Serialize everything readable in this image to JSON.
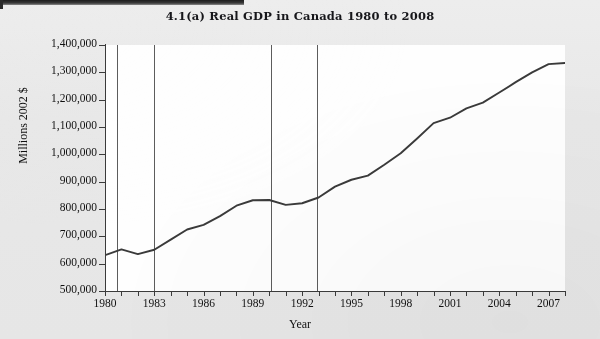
{
  "chart_data": {
    "type": "line",
    "title": "4.1(a) Real GDP in Canada 1980 to 2008",
    "xlabel": "Year",
    "ylabel": "Millions 2002 $",
    "ylim": [
      500000,
      1400000
    ],
    "xlim": [
      1980,
      2008
    ],
    "grid": false,
    "legend": "none",
    "y_ticks": [
      "500,000",
      "600,000",
      "700,000",
      "800,000",
      "900,000",
      "1,000,000",
      "1,100,000",
      "1,200,000",
      "1,300,000",
      "1,400,000"
    ],
    "y_tick_values": [
      500000,
      600000,
      700000,
      800000,
      900000,
      1000000,
      1100000,
      1200000,
      1300000,
      1400000
    ],
    "x_ticks_labeled": [
      "1980",
      "1983",
      "1986",
      "1989",
      "1992",
      "1995",
      "1998",
      "2001",
      "2004",
      "2007"
    ],
    "x_tick_values_all": [
      1980,
      1981,
      1982,
      1983,
      1984,
      1985,
      1986,
      1987,
      1988,
      1989,
      1990,
      1991,
      1992,
      1993,
      1994,
      1995,
      1996,
      1997,
      1998,
      1999,
      2000,
      2001,
      2002,
      2003,
      2004,
      2005,
      2006,
      2007,
      2008
    ],
    "series": [
      {
        "name": "Real GDP (Millions 2002 $)",
        "x": [
          1980,
          1981,
          1982,
          1983,
          1984,
          1985,
          1986,
          1987,
          1988,
          1989,
          1990,
          1991,
          1992,
          1993,
          1994,
          1995,
          1996,
          1997,
          1998,
          1999,
          2000,
          2001,
          2002,
          2003,
          2004,
          2005,
          2006,
          2007,
          2008
        ],
        "values": [
          631000,
          652000,
          635000,
          651000,
          688000,
          725000,
          742000,
          774000,
          812000,
          832000,
          833000,
          815000,
          821000,
          842000,
          882000,
          907000,
          922000,
          962000,
          1004000,
          1058000,
          1114000,
          1134000,
          1168000,
          1189000,
          1226000,
          1264000,
          1300000,
          1330000,
          1334000
        ]
      }
    ],
    "annotations": [
      {
        "name": "recession-marker-1",
        "type": "vline",
        "x": 1980.7
      },
      {
        "name": "recession-marker-2",
        "type": "vline",
        "x": 1983.0
      },
      {
        "name": "recession-marker-3",
        "type": "vline",
        "x": 1990.1
      },
      {
        "name": "recession-marker-4",
        "type": "vline",
        "x": 1992.9
      }
    ]
  }
}
